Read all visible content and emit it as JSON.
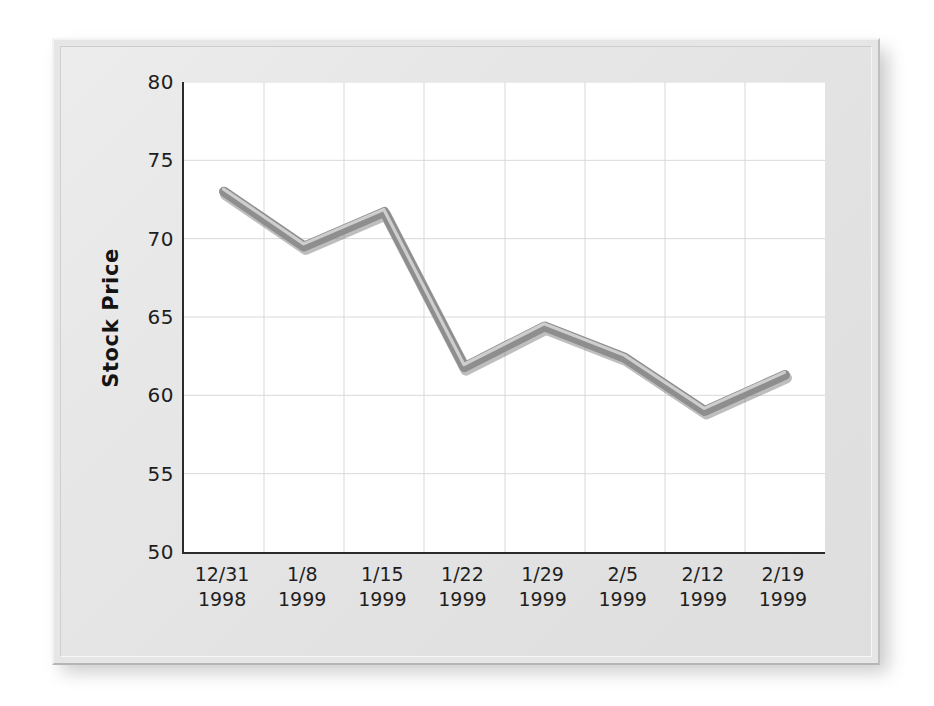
{
  "chart_data": {
    "type": "line",
    "title": "",
    "xlabel": "",
    "ylabel": "Stock Price",
    "ylim": [
      50,
      80
    ],
    "ytick_step": 5,
    "yticks": [
      80,
      75,
      70,
      65,
      60,
      55,
      50
    ],
    "grid": true,
    "legend": false,
    "categories": [
      "12/31\n1998",
      "1/8\n1999",
      "1/15\n1999",
      "1/22\n1999",
      "1/29\n1999",
      "2/5\n1999",
      "2/12\n1999",
      "2/19\n1999"
    ],
    "x_tick_lines": [
      [
        "12/31",
        "1998"
      ],
      [
        "1/8",
        "1999"
      ],
      [
        "1/15",
        "1999"
      ],
      [
        "1/22",
        "1999"
      ],
      [
        "1/29",
        "1999"
      ],
      [
        "2/5",
        "1999"
      ],
      [
        "2/12",
        "1999"
      ],
      [
        "2/19",
        "1999"
      ]
    ],
    "series": [
      {
        "name": "Stock Price",
        "values": [
          73.0,
          69.5,
          71.7,
          61.8,
          64.4,
          62.4,
          59.0,
          61.3
        ]
      }
    ]
  },
  "style": {
    "line_color": "#8e8e8e",
    "line_highlight": "#d2d2d2",
    "line_shadow": "#6f6f6f",
    "grid_color": "#d9d9d9",
    "axis_color": "#2b2b2b",
    "plot_background": "#ffffff",
    "panel_background": "#e6e6e6",
    "text_color": "#1e1e1e"
  }
}
